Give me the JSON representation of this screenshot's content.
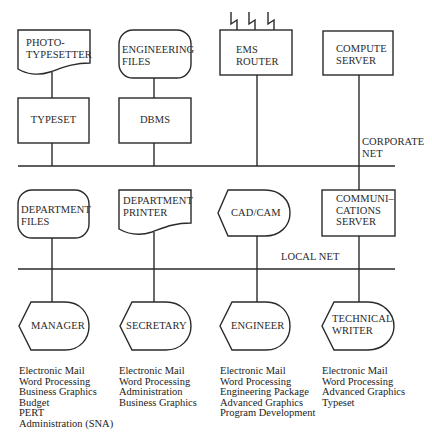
{
  "diagram": {
    "networks": {
      "corporate": {
        "label_line1": "CORPORATE",
        "label_line2": "NET"
      },
      "local": {
        "label": "LOCAL NET"
      }
    },
    "top_row": {
      "phototypesetter": {
        "line1": "PHOTO-",
        "line2": "TYPESETTER",
        "shape": "document"
      },
      "engineering_files": {
        "line1": "ENGINEERING",
        "line2": "FILES",
        "shape": "rounded-storage"
      },
      "ems_router": {
        "line1": "EMS",
        "line2": "ROUTER",
        "shape": "box-with-lightning-links",
        "links": 3
      },
      "compute_server": {
        "line1": "COMPUTE",
        "line2": "SERVER",
        "shape": "box"
      }
    },
    "second_row": {
      "typeset": {
        "label": "TYPESET",
        "shape": "box"
      },
      "dbms": {
        "label": "DBMS",
        "shape": "box"
      }
    },
    "middle_row": {
      "department_files": {
        "line1": "DEPARTMENT",
        "line2": "FILES",
        "shape": "rounded-storage"
      },
      "department_printer": {
        "line1": "DEPARTMENT",
        "line2": "PRINTER",
        "shape": "document"
      },
      "cad_cam": {
        "label": "CAD/CAM",
        "shape": "display"
      },
      "communications_server": {
        "line1": "COMMUNI–",
        "line2": "CATIONS",
        "line3": "SERVER",
        "shape": "box"
      }
    },
    "workstations": [
      {
        "label": "MANAGER",
        "shape": "display",
        "applications": [
          "Electronic Mail",
          "Word Processing",
          "Business Graphics",
          "Budget",
          "PERT",
          "Administration (SNA)"
        ]
      },
      {
        "label": "SECRETARY",
        "shape": "display",
        "applications": [
          "Electronic Mail",
          "Word Processing",
          "Administration",
          "Business Graphics"
        ]
      },
      {
        "label": "ENGINEER",
        "shape": "display",
        "applications": [
          "Electronic Mail",
          "Word Processing",
          "Engineering Package",
          "Advanced Graphics",
          "Program Development"
        ]
      },
      {
        "label_line1": "TECHNICAL",
        "label_line2": "WRITER",
        "shape": "display",
        "applications": [
          "Electronic Mail",
          "Word Processing",
          "Advanced Graphics",
          "Typeset"
        ]
      }
    ],
    "colors": {
      "ink": "#2a2a2a",
      "background": "#ffffff"
    }
  }
}
